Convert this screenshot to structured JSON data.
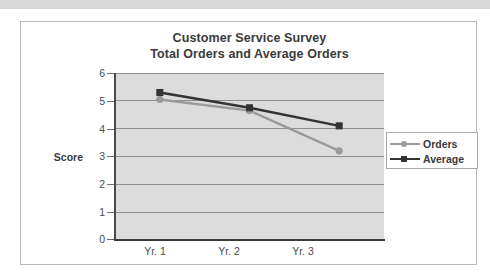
{
  "chart_data": {
    "type": "line",
    "title": "Customer Service Survey",
    "subtitle": "Total Orders and Average Orders",
    "xlabel": "",
    "ylabel": "Score",
    "categories": [
      "Yr. 1",
      "Yr. 2",
      "Yr. 3"
    ],
    "ylim": [
      0,
      6
    ],
    "yticks": [
      "0",
      "1",
      "2",
      "3",
      "4",
      "5",
      "6"
    ],
    "grid": true,
    "legend_position": "right",
    "plot_background": "#dcdcdc",
    "series": [
      {
        "name": "Orders",
        "values": [
          5.05,
          4.65,
          3.2
        ],
        "color": "#9a9a9a",
        "marker": "circle"
      },
      {
        "name": "Average",
        "values": [
          5.3,
          4.75,
          4.1
        ],
        "color": "#333333",
        "marker": "square"
      }
    ]
  },
  "figure": {
    "title_line1": "Customer Service Survey",
    "title_line2": "Total Orders and Average Orders",
    "y_axis_title": "Score",
    "y_ticks": [
      "6",
      "5",
      "4",
      "3",
      "2",
      "1",
      "0"
    ],
    "x_ticks": [
      "Yr. 1",
      "Yr. 2",
      "Yr. 3"
    ],
    "legend": [
      {
        "label": "Orders",
        "color": "#9a9a9a",
        "marker": "circle-marker"
      },
      {
        "label": "Average",
        "color": "#333333",
        "marker": "square-marker"
      }
    ]
  }
}
